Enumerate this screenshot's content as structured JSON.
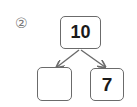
{
  "problem": {
    "label": "②",
    "whole": "10",
    "parts": [
      "",
      "7"
    ]
  },
  "colors": {
    "border": "#6b6b6b",
    "text": "#1a1a1a",
    "label": "#777777"
  }
}
